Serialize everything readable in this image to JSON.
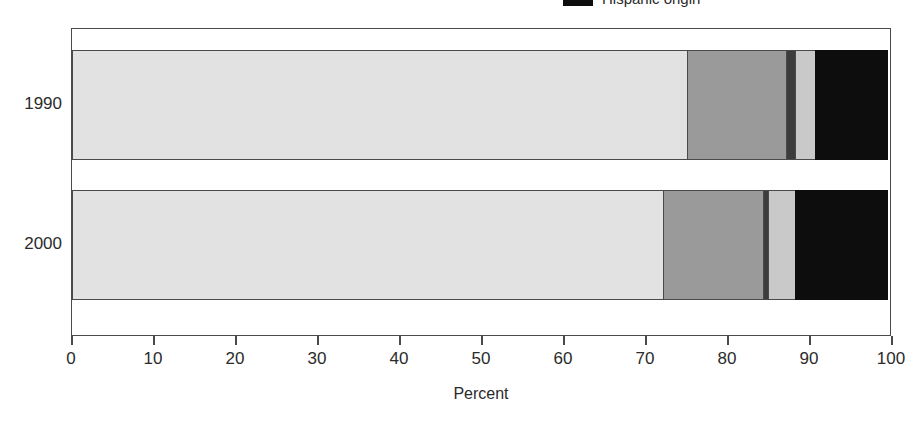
{
  "legend": {
    "items": [
      {
        "label": "Hispanic origin",
        "color": "#0d0d0d",
        "swatch_name": "legend-swatch-hispanic"
      }
    ]
  },
  "axes": {
    "x_title": "Percent",
    "x_ticks": [
      "0",
      "10",
      "20",
      "30",
      "40",
      "50",
      "60",
      "70",
      "80",
      "90",
      "100"
    ],
    "y_categories": [
      "1990",
      "2000"
    ]
  },
  "chart_data": {
    "type": "bar",
    "orientation": "horizontal",
    "stacked": true,
    "percent_stacked": true,
    "title": "",
    "subtitle": "",
    "xlabel": "Percent",
    "ylabel": "",
    "xlim": [
      0,
      100
    ],
    "xticks": [
      0,
      10,
      20,
      30,
      40,
      50,
      60,
      70,
      80,
      90,
      100
    ],
    "grid": false,
    "legend_position": "top-right",
    "categories": [
      "1990",
      "2000"
    ],
    "series": [
      {
        "name": "White",
        "color": "#e2e2e2",
        "values": [
          75.1,
          72.2
        ]
      },
      {
        "name": "Black",
        "color": "#9a9a9a",
        "values": [
          12.2,
          12.3
        ]
      },
      {
        "name": "American Indian, Eskimo, or Aleut",
        "color": "#3c3c3c",
        "values": [
          1.2,
          0.7
        ]
      },
      {
        "name": "Asian or Pacific Islander",
        "color": "#c9c9c9",
        "values": [
          2.6,
          3.5
        ]
      },
      {
        "name": "Hispanic origin",
        "color": "#0d0d0d",
        "values": [
          8.9,
          11.3
        ]
      }
    ],
    "annotations": []
  }
}
